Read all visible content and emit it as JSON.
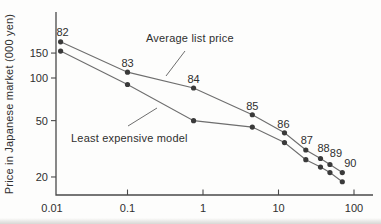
{
  "chart_data": {
    "type": "line",
    "title": "",
    "xlabel": "",
    "ylabel": "Price in Japanese market (000 yen)",
    "x_scale": "log",
    "y_scale": "log",
    "xlim": [
      0.01,
      200
    ],
    "ylim": [
      15,
      230
    ],
    "grid": false,
    "legend_position": "inline-annotations",
    "x_ticks": [
      0.01,
      0.1,
      1,
      10,
      100
    ],
    "x_tick_labels": [
      "0.01",
      "0.1",
      "1",
      "10",
      "100"
    ],
    "y_ticks": [
      150,
      100,
      50,
      20
    ],
    "y_tick_labels": [
      "150",
      "100",
      "50",
      "20"
    ],
    "point_labels": [
      "82",
      "83",
      "84",
      "85",
      "86",
      "87",
      "88",
      "89",
      "90"
    ],
    "x": [
      0.013,
      0.1,
      0.75,
      4.5,
      12,
      23,
      36,
      48,
      70
    ],
    "series": [
      {
        "name": "Average list price",
        "values": [
          180,
          110,
          85,
          55,
          41,
          31,
          27,
          24.5,
          21.5
        ]
      },
      {
        "name": "Least expensive model",
        "values": [
          155,
          90,
          50,
          45,
          35,
          26.5,
          23.5,
          21.5,
          18.5
        ]
      }
    ],
    "annotations": [
      {
        "text": "Average list price"
      },
      {
        "text": "Least expensive model"
      }
    ],
    "colors": {
      "line": "#6e6e6e",
      "point": "#3a3a3a",
      "axis": "#4a4a4a",
      "text": "#2f2f2f",
      "background": "#fdfdfc"
    }
  }
}
